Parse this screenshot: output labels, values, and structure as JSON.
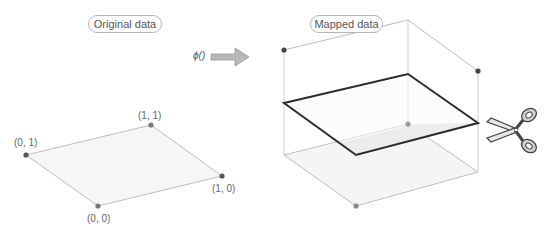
{
  "labels": {
    "original": "Original data",
    "mapped": "Mapped data",
    "mapping_function": "ϕ()"
  },
  "points": {
    "p01": "(0, 1)",
    "p11": "(1, 1)",
    "p10": "(1, 0)",
    "p00": "(0, 0)"
  },
  "icons": {
    "arrow": "right-arrow-icon",
    "scissors": "scissors-icon"
  },
  "colors": {
    "dot": "#555555",
    "edge": "#bdbdbd",
    "plane_edge": "#2b2b2b",
    "plane_fill": "#f4f4f4",
    "cut_fill": "#dcdcdc",
    "arrow_fill": "#b7b7b7"
  },
  "caption": ""
}
